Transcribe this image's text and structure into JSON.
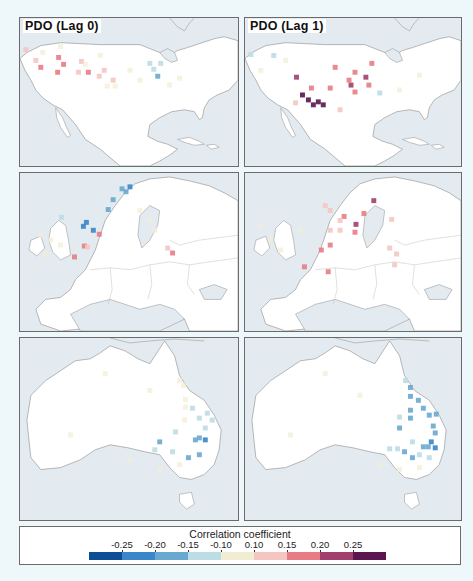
{
  "figure": {
    "panels": [
      {
        "id": "usa-lag0",
        "title": "PDO (Lag 0)",
        "region": "usa"
      },
      {
        "id": "usa-lag1",
        "title": "PDO (Lag 1)",
        "region": "usa"
      },
      {
        "id": "europe-lag0",
        "title": "",
        "region": "europe"
      },
      {
        "id": "europe-lag1",
        "title": "",
        "region": "europe"
      },
      {
        "id": "australia-lag0",
        "title": "",
        "region": "australia"
      },
      {
        "id": "australia-lag1",
        "title": "",
        "region": "australia"
      }
    ],
    "legend": {
      "title": "Correlation coefficient",
      "ticks": [
        "-0.25",
        "-0.20",
        "-0.15",
        "-0.10",
        "0.10",
        "0.15",
        "0.20",
        "0.25"
      ],
      "colors": [
        "#0d4f96",
        "#3b86c8",
        "#6aa9cf",
        "#bcdce6",
        "#f1edd3",
        "#f4c6c1",
        "#e77c84",
        "#a13f6e",
        "#5b1650"
      ]
    },
    "colors": {
      "ocean": "#e3ebf1",
      "land": "#ffffff",
      "coast": "#8a8a8a",
      "page_bg": "#eef8fb"
    }
  },
  "chart_data": {
    "type": "heatmap",
    "panels": [
      "PDO (Lag 0)",
      "PDO (Lag 1)"
    ],
    "rows": [
      "USA",
      "Europe",
      "Australia"
    ],
    "colorbar": {
      "label": "Correlation coefficient",
      "bins": [
        "<-0.25",
        "-0.25 to -0.20",
        "-0.20 to -0.15",
        "-0.15 to -0.10",
        "-0.10 to 0.10",
        "0.10 to 0.15",
        "0.15 to 0.20",
        "0.20 to 0.25",
        ">0.25"
      ],
      "ticks": [
        -0.25,
        -0.2,
        -0.15,
        -0.1,
        0.1,
        0.15,
        0.2,
        0.25
      ]
    },
    "cells": {
      "usa-lag0": [
        [
          25,
          49,
          5
        ],
        [
          35,
          60,
          5
        ],
        [
          40,
          67,
          6
        ],
        [
          58,
          57,
          6
        ],
        [
          63,
          64,
          6
        ],
        [
          57,
          72,
          6
        ],
        [
          81,
          61,
          5
        ],
        [
          85,
          64,
          4
        ],
        [
          78,
          72,
          5
        ],
        [
          88,
          72,
          6
        ],
        [
          99,
          76,
          5
        ],
        [
          104,
          70,
          5
        ],
        [
          113,
          80,
          5
        ],
        [
          150,
          63,
          3
        ],
        [
          154,
          69,
          3
        ],
        [
          158,
          76,
          2
        ],
        [
          161,
          63,
          3
        ],
        [
          107,
          86,
          4
        ],
        [
          115,
          86,
          4
        ],
        [
          42,
          52,
          4
        ],
        [
          60,
          46,
          4
        ],
        [
          100,
          55,
          4
        ],
        [
          130,
          70,
          4
        ],
        [
          140,
          80,
          4
        ],
        [
          170,
          85,
          4
        ],
        [
          180,
          78,
          4
        ]
      ],
      "usa-lag1": [
        [
          250,
          54,
          3
        ],
        [
          273,
          55,
          3
        ],
        [
          296,
          77,
          7
        ],
        [
          302,
          95,
          8
        ],
        [
          308,
          100,
          8
        ],
        [
          313,
          105,
          8
        ],
        [
          318,
          102,
          8
        ],
        [
          323,
          105,
          8
        ],
        [
          311,
          88,
          6
        ],
        [
          330,
          88,
          6
        ],
        [
          335,
          67,
          6
        ],
        [
          349,
          80,
          6
        ],
        [
          355,
          72,
          6
        ],
        [
          351,
          85,
          7
        ],
        [
          366,
          77,
          7
        ],
        [
          369,
          85,
          6
        ],
        [
          355,
          92,
          6
        ],
        [
          372,
          63,
          6
        ],
        [
          380,
          93,
          3
        ],
        [
          295,
          103,
          5
        ],
        [
          340,
          110,
          5
        ],
        [
          260,
          70,
          4
        ],
        [
          285,
          60,
          4
        ],
        [
          400,
          90,
          4
        ],
        [
          420,
          75,
          4
        ]
      ],
      "europe-lag0": [
        [
          130,
          186,
          1
        ],
        [
          126,
          191,
          2
        ],
        [
          122,
          188,
          2
        ],
        [
          113,
          199,
          2
        ],
        [
          108,
          209,
          2
        ],
        [
          86,
          222,
          1
        ],
        [
          83,
          226,
          1
        ],
        [
          93,
          230,
          1
        ],
        [
          61,
          217,
          3
        ],
        [
          99,
          234,
          6
        ],
        [
          84,
          246,
          6
        ],
        [
          74,
          257,
          6
        ],
        [
          87,
          247,
          5
        ],
        [
          173,
          253,
          6
        ],
        [
          168,
          248,
          5
        ],
        [
          150,
          220,
          4
        ],
        [
          155,
          230,
          4
        ],
        [
          140,
          210,
          4
        ],
        [
          40,
          235,
          4
        ],
        [
          50,
          240,
          4
        ],
        [
          60,
          245,
          4
        ],
        [
          45,
          255,
          4
        ]
      ],
      "europe-lag1": [
        [
          374,
          200,
          7
        ],
        [
          364,
          213,
          6
        ],
        [
          344,
          216,
          6
        ],
        [
          356,
          224,
          7
        ],
        [
          355,
          232,
          6
        ],
        [
          340,
          220,
          5
        ],
        [
          340,
          230,
          5
        ],
        [
          330,
          230,
          5
        ],
        [
          325,
          205,
          5
        ],
        [
          330,
          210,
          5
        ],
        [
          330,
          245,
          6
        ],
        [
          321,
          250,
          6
        ],
        [
          304,
          267,
          6
        ],
        [
          328,
          272,
          6
        ],
        [
          390,
          248,
          5
        ],
        [
          397,
          254,
          5
        ],
        [
          392,
          219,
          5
        ],
        [
          395,
          265,
          5
        ],
        [
          260,
          225,
          4
        ],
        [
          270,
          240,
          4
        ],
        [
          280,
          250,
          4
        ],
        [
          300,
          230,
          4
        ]
      ],
      "australia-lag0": [
        [
          180,
          380,
          4
        ],
        [
          184,
          385,
          4
        ],
        [
          186,
          399,
          4
        ],
        [
          186,
          407,
          4
        ],
        [
          185,
          420,
          4
        ],
        [
          193,
          408,
          3
        ],
        [
          200,
          418,
          3
        ],
        [
          206,
          428,
          3
        ],
        [
          196,
          440,
          2
        ],
        [
          206,
          440,
          1
        ],
        [
          200,
          455,
          2
        ],
        [
          189,
          458,
          2
        ],
        [
          173,
          452,
          3
        ],
        [
          160,
          442,
          2
        ],
        [
          155,
          450,
          3
        ],
        [
          176,
          432,
          3
        ],
        [
          213,
          420,
          3
        ],
        [
          200,
          438,
          2
        ],
        [
          208,
          413,
          3
        ],
        [
          105,
          373,
          4
        ],
        [
          150,
          390,
          4
        ],
        [
          70,
          435,
          4
        ],
        [
          180,
          465,
          4
        ],
        [
          160,
          470,
          4
        ],
        [
          130,
          460,
          4
        ]
      ],
      "australia-lag1": [
        [
          406,
          380,
          3
        ],
        [
          411,
          387,
          2
        ],
        [
          411,
          396,
          2
        ],
        [
          411,
          410,
          2
        ],
        [
          411,
          418,
          2
        ],
        [
          419,
          400,
          2
        ],
        [
          424,
          408,
          2
        ],
        [
          430,
          415,
          2
        ],
        [
          437,
          414,
          2
        ],
        [
          434,
          426,
          2
        ],
        [
          436,
          433,
          2
        ],
        [
          432,
          442,
          1
        ],
        [
          436,
          448,
          1
        ],
        [
          429,
          447,
          2
        ],
        [
          424,
          447,
          2
        ],
        [
          413,
          442,
          3
        ],
        [
          405,
          452,
          2
        ],
        [
          420,
          455,
          3
        ],
        [
          390,
          449,
          3
        ],
        [
          398,
          449,
          3
        ],
        [
          413,
          458,
          2
        ],
        [
          430,
          458,
          3
        ],
        [
          400,
          417,
          3
        ],
        [
          400,
          428,
          2
        ],
        [
          325,
          373,
          4
        ],
        [
          360,
          395,
          4
        ],
        [
          290,
          435,
          4
        ],
        [
          420,
          468,
          4
        ],
        [
          400,
          470,
          4
        ],
        [
          380,
          465,
          4
        ]
      ]
    }
  }
}
